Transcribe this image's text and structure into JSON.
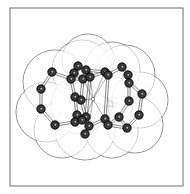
{
  "figure": {
    "frame": {
      "x": 10,
      "y": 8,
      "width": 173,
      "height": 178,
      "stroke": "#6e6e6e"
    },
    "colors": {
      "surface_stroke": "#707070",
      "surface_fill": "#ffffff",
      "atom_fill": "#2b2b2b",
      "atom_ring": "#000000",
      "atom_highlight": "#bdbdbd",
      "bond": "#555555",
      "background": "#ffffff"
    },
    "surface_spheres": [
      {
        "cx": 55,
        "cy": 82,
        "r": 32
      },
      {
        "cx": 46,
        "cy": 112,
        "r": 30
      },
      {
        "cx": 62,
        "cy": 130,
        "r": 28
      },
      {
        "cx": 82,
        "cy": 70,
        "r": 30
      },
      {
        "cx": 88,
        "cy": 60,
        "r": 26
      },
      {
        "cx": 80,
        "cy": 105,
        "r": 29
      },
      {
        "cx": 85,
        "cy": 130,
        "r": 30
      },
      {
        "cx": 112,
        "cy": 70,
        "r": 28
      },
      {
        "cx": 125,
        "cy": 75,
        "r": 30
      },
      {
        "cx": 140,
        "cy": 100,
        "r": 28
      },
      {
        "cx": 135,
        "cy": 125,
        "r": 28
      },
      {
        "cx": 112,
        "cy": 132,
        "r": 26
      },
      {
        "cx": 110,
        "cy": 100,
        "r": 24
      }
    ],
    "atoms": [
      {
        "x": 52,
        "y": 72
      },
      {
        "x": 41,
        "y": 89
      },
      {
        "x": 41,
        "y": 109
      },
      {
        "x": 55,
        "y": 125
      },
      {
        "x": 78,
        "y": 66
      },
      {
        "x": 74,
        "y": 73
      },
      {
        "x": 86,
        "y": 70
      },
      {
        "x": 71,
        "y": 79
      },
      {
        "x": 83,
        "y": 79
      },
      {
        "x": 90,
        "y": 77
      },
      {
        "x": 75,
        "y": 97
      },
      {
        "x": 81,
        "y": 100
      },
      {
        "x": 105,
        "y": 72
      },
      {
        "x": 108,
        "y": 75
      },
      {
        "x": 122,
        "y": 67
      },
      {
        "x": 128,
        "y": 75
      },
      {
        "x": 129,
        "y": 83
      },
      {
        "x": 142,
        "y": 94
      },
      {
        "x": 129,
        "y": 101
      },
      {
        "x": 139,
        "y": 115
      },
      {
        "x": 119,
        "y": 117
      },
      {
        "x": 127,
        "y": 128
      },
      {
        "x": 77,
        "y": 115
      },
      {
        "x": 86,
        "y": 117
      },
      {
        "x": 75,
        "y": 122
      },
      {
        "x": 82,
        "y": 120
      },
      {
        "x": 89,
        "y": 126
      },
      {
        "x": 85,
        "y": 134
      },
      {
        "x": 105,
        "y": 119
      },
      {
        "x": 108,
        "y": 125
      }
    ],
    "small_atoms": [
      {
        "x": 93,
        "y": 99
      }
    ],
    "bonds": [
      [
        0,
        1
      ],
      [
        1,
        2
      ],
      [
        2,
        3
      ],
      [
        0,
        7
      ],
      [
        3,
        24
      ],
      [
        4,
        5
      ],
      [
        4,
        6
      ],
      [
        5,
        7
      ],
      [
        6,
        9
      ],
      [
        7,
        8
      ],
      [
        8,
        9
      ],
      [
        5,
        8
      ],
      [
        7,
        10
      ],
      [
        10,
        11
      ],
      [
        10,
        22
      ],
      [
        11,
        23
      ],
      [
        8,
        11
      ],
      [
        9,
        12
      ],
      [
        12,
        13
      ],
      [
        6,
        12
      ],
      [
        13,
        14
      ],
      [
        14,
        15
      ],
      [
        15,
        16
      ],
      [
        16,
        17
      ],
      [
        17,
        19
      ],
      [
        19,
        21
      ],
      [
        21,
        20
      ],
      [
        20,
        18
      ],
      [
        18,
        16
      ],
      [
        20,
        29
      ],
      [
        22,
        23
      ],
      [
        22,
        24
      ],
      [
        23,
        26
      ],
      [
        24,
        25
      ],
      [
        25,
        26
      ],
      [
        26,
        27
      ],
      [
        25,
        23
      ],
      [
        26,
        28
      ],
      [
        28,
        29
      ],
      [
        29,
        21
      ],
      [
        13,
        28
      ],
      [
        9,
        23
      ]
    ],
    "thin_lines": [
      [
        93,
        99,
        83,
        79
      ],
      [
        93,
        99,
        90,
        77
      ],
      [
        93,
        99,
        105,
        72
      ],
      [
        93,
        99,
        108,
        75
      ],
      [
        93,
        99,
        86,
        117
      ],
      [
        93,
        99,
        89,
        126
      ],
      [
        93,
        99,
        105,
        119
      ],
      [
        93,
        99,
        81,
        100
      ]
    ]
  }
}
